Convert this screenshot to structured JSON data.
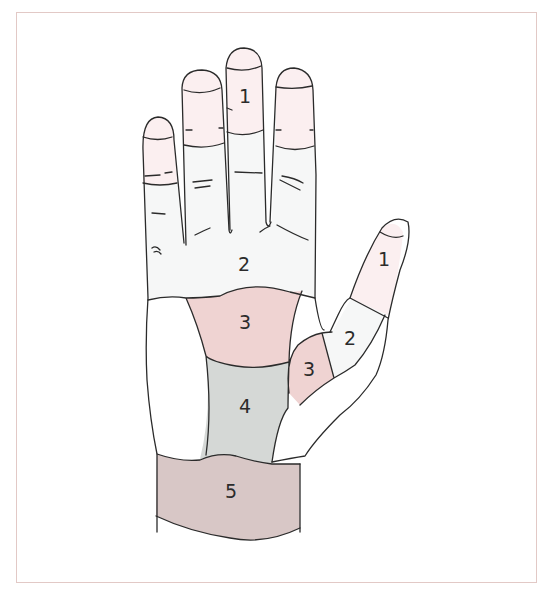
{
  "figure": {
    "colors": {
      "frame_border": "#e2c9c6",
      "outline": "#2b2b2b",
      "zone1": "#fbeff0",
      "zone2": "#f6f7f7",
      "zone3": "#efd3d2",
      "zone4": "#d5d8d6",
      "zone5": "#d8c7c6",
      "unshaded": "#ffffff"
    },
    "labels": {
      "finger_tip_zone": "1",
      "palm_upper_zone": "2",
      "palm_center_zone": "3",
      "palm_lower_zone": "4",
      "wrist_zone": "5",
      "thumb_tip_zone": "1",
      "thumb_middle_zone": "2",
      "thumb_base_zone": "3"
    }
  }
}
